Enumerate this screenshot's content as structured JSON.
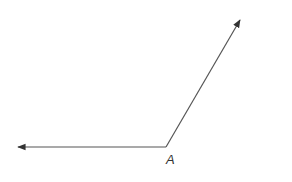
{
  "diagram": {
    "type": "angle",
    "vertex": {
      "label": "A",
      "x": 166,
      "y": 147
    },
    "rays": [
      {
        "name": "left-ray",
        "from": [
          166,
          147
        ],
        "to": [
          17,
          147
        ]
      },
      {
        "name": "upper-right-ray",
        "from": [
          166,
          147
        ],
        "to": [
          240,
          20
        ]
      }
    ],
    "stroke_color": "#444444"
  }
}
